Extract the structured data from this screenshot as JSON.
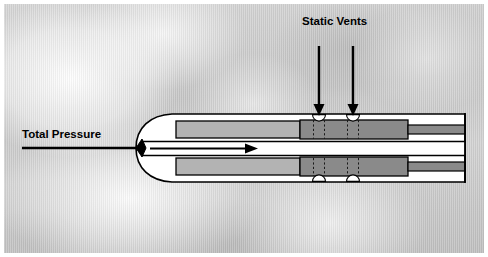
{
  "figure": {
    "width": 488,
    "height": 257,
    "background_kind": "cloudy-sky-photo",
    "border_color": "#ffffff"
  },
  "labels": {
    "static_vents": "Static Vents",
    "total_pressure": "Total Pressure"
  },
  "colors": {
    "outline": "#000000",
    "chamber_light_gray": "#b3b3b3",
    "vent_section_gray": "#8a8a8a",
    "interior_white": "#ffffff",
    "sky_base": "#cccccc",
    "arrow": "#000000"
  },
  "annotations": {
    "static_vent_arrows": [
      {
        "name": "static-vent-arrow-left",
        "x": 319,
        "y_from": 46,
        "y_to": 114
      },
      {
        "name": "static-vent-arrow-right",
        "x": 353,
        "y_from": 46,
        "y_to": 114
      }
    ],
    "total_pressure_arrow": {
      "name": "total-pressure-arrow",
      "x_from": 22,
      "x_to": 255,
      "y": 148
    }
  },
  "parts": {
    "nose": "rounded pitot tube nose with black diamond total-pressure port",
    "upper_chamber": "static chamber, light gray",
    "lower_chamber": "static chamber, light gray",
    "vent_band": "darker gray vent section with two semicircular static vent openings top and bottom",
    "central_bore": "white total pressure bore running the length of the tube",
    "tail": "stepped mounting stem at right"
  }
}
